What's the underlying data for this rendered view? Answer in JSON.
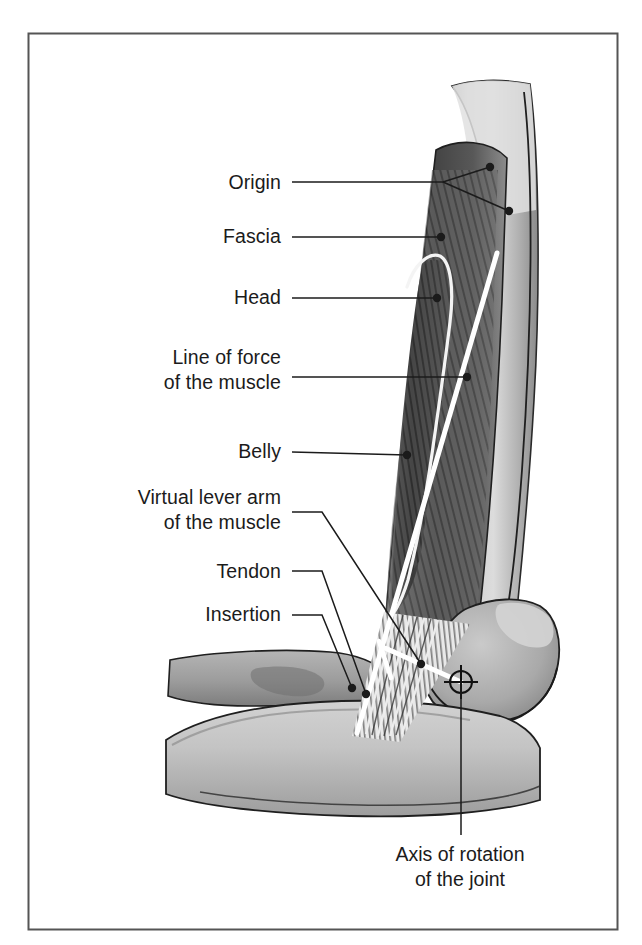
{
  "figure": {
    "kind": "anatomical-illustration",
    "border_color": "#555555",
    "background_color": "#ffffff",
    "ink_color": "#1b1b1b",
    "highlight_color": "#ffffff"
  },
  "labels": [
    {
      "id": "origin",
      "text": "Origin",
      "text_x": 281,
      "text_y": 189,
      "anchor": "end",
      "lines": [
        {
          "type": "polyline",
          "points": "292,182 443,182 490,167"
        },
        {
          "type": "polyline",
          "points": "443,182 509,211"
        }
      ],
      "dots": [
        {
          "cx": 490,
          "cy": 167,
          "r": 4.2
        },
        {
          "cx": 509,
          "cy": 211,
          "r": 4.2
        }
      ]
    },
    {
      "id": "fascia",
      "text": "Fascia",
      "text_x": 281,
      "text_y": 243,
      "anchor": "end",
      "lines": [
        {
          "type": "polyline",
          "points": "292,237 441,237"
        }
      ],
      "dots": [
        {
          "cx": 441,
          "cy": 237,
          "r": 4.2
        }
      ]
    },
    {
      "id": "head",
      "text": "Head",
      "text_x": 281,
      "text_y": 304,
      "anchor": "end",
      "lines": [
        {
          "type": "polyline",
          "points": "292,298 437,298"
        }
      ],
      "dots": [
        {
          "cx": 437,
          "cy": 298,
          "r": 4.2
        }
      ]
    },
    {
      "id": "line-of-force",
      "text_lines": [
        "Line of force",
        "of the muscle"
      ],
      "text_x": 281,
      "text_y": 364,
      "line_height": 25,
      "anchor": "end",
      "lines": [
        {
          "type": "polyline",
          "points": "292,377 467,377"
        }
      ],
      "dots": [
        {
          "cx": 467,
          "cy": 377,
          "r": 4.2
        }
      ]
    },
    {
      "id": "belly",
      "text": "Belly",
      "text_x": 281,
      "text_y": 458,
      "anchor": "end",
      "lines": [
        {
          "type": "polyline",
          "points": "292,452 407,455"
        }
      ],
      "dots": [
        {
          "cx": 407,
          "cy": 455,
          "r": 4.2
        }
      ]
    },
    {
      "id": "virtual-lever-arm",
      "text_lines": [
        "Virtual lever arm",
        "of the muscle"
      ],
      "text_x": 281,
      "text_y": 504,
      "line_height": 25,
      "anchor": "end",
      "lines": [
        {
          "type": "polyline",
          "points": "292,512 322,512 421,664"
        }
      ],
      "dots": [
        {
          "cx": 421,
          "cy": 664,
          "r": 4.2
        }
      ]
    },
    {
      "id": "tendon",
      "text": "Tendon",
      "text_x": 281,
      "text_y": 578,
      "anchor": "end",
      "lines": [
        {
          "type": "polyline",
          "points": "292,571 322,571 366,694"
        }
      ],
      "dots": [
        {
          "cx": 366,
          "cy": 694,
          "r": 4.2
        }
      ]
    },
    {
      "id": "insertion",
      "text": "Insertion",
      "text_x": 281,
      "text_y": 621,
      "anchor": "end",
      "lines": [
        {
          "type": "polyline",
          "points": "292,615 322,615 352,688"
        }
      ],
      "dots": [
        {
          "cx": 352,
          "cy": 688,
          "r": 4.2
        }
      ]
    },
    {
      "id": "axis-of-rotation",
      "text_lines": [
        "Axis of rotation",
        "of the joint"
      ],
      "text_x": 460,
      "text_y": 861,
      "line_height": 25,
      "anchor": "middle",
      "lines": [
        {
          "type": "polyline",
          "points": "461,683 461,835"
        }
      ],
      "dots": []
    }
  ],
  "markers": {
    "axis_of_rotation": {
      "cx": 461,
      "cy": 682,
      "r": 11
    },
    "line_of_force": {
      "x1": 497,
      "y1": 253,
      "x2": 357,
      "y2": 733
    },
    "lever_arm": {
      "x1": 385,
      "y1": 648,
      "x2": 461,
      "y2": 682
    },
    "lever_arm_tick": {
      "x1": 379,
      "y1": 641,
      "x2": 391,
      "y2": 678
    }
  }
}
